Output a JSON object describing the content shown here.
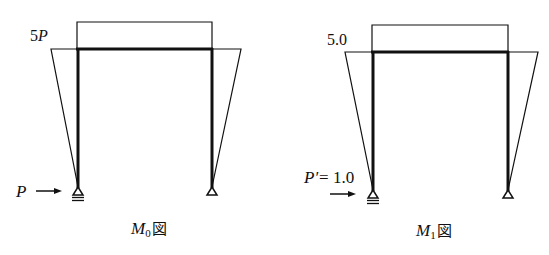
{
  "colors": {
    "line": "#111111",
    "background": "#ffffff"
  },
  "diagrams": [
    {
      "id": "M0",
      "caption_main": "M",
      "caption_sub": "0",
      "caption_suffix": "図",
      "moment_label": "5P",
      "moment_label_num": "5",
      "moment_label_var": "P",
      "load_label": "P",
      "load_arrow": "→"
    },
    {
      "id": "M1",
      "caption_main": "M",
      "caption_sub": "1",
      "caption_suffix": "図",
      "moment_label": "5.0",
      "load_label_var": "P′",
      "load_label_eq": "= 1.0",
      "load_arrow": "→"
    }
  ]
}
